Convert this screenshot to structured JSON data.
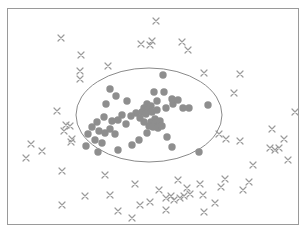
{
  "figure": {
    "caption": "",
    "frame": {
      "x": 7,
      "y": 8,
      "width": 292,
      "height": 217,
      "stroke": "#9a9a9a",
      "stroke_width": 1,
      "fill": "#ffffff"
    }
  },
  "colors": {
    "background": "#ffffff",
    "frame_border": "#9a9a9a",
    "inlier_marker": "#8e8e8e",
    "outlier_marker": "#9b9b9b",
    "ellipse_stroke": "#8a8a8a",
    "caption_text": "#cfcfcf"
  },
  "chart_data": {
    "type": "scatter",
    "title": "",
    "xlabel": "",
    "ylabel": "",
    "grid": false,
    "legend": null,
    "axis_visible": false,
    "xlim": [
      7,
      299
    ],
    "ylim": [
      8,
      225
    ],
    "note": "Pixel coordinates in the image frame; y increases downward.",
    "annotations": [
      {
        "kind": "ellipse",
        "name": "cluster-boundary-ellipse",
        "cx": 149,
        "cy": 115,
        "rx": 73,
        "ry": 47,
        "rotation_deg": 0,
        "stroke": "#8a8a8a",
        "stroke_width": 1,
        "fill": "none"
      }
    ],
    "series": [
      {
        "name": "inliers",
        "marker": "circle",
        "marker_size": 5,
        "color": "#8e8e8e",
        "count": 56,
        "points": [
          [
            163,
            75
          ],
          [
            154,
            92
          ],
          [
            157,
            101
          ],
          [
            164,
            92
          ],
          [
            110,
            89
          ],
          [
            116,
            96
          ],
          [
            106,
            104
          ],
          [
            127,
            101
          ],
          [
            147,
            104
          ],
          [
            151,
            106
          ],
          [
            144,
            108
          ],
          [
            148,
            110
          ],
          [
            142,
            112
          ],
          [
            146,
            114
          ],
          [
            152,
            112
          ],
          [
            157,
            110
          ],
          [
            166,
            108
          ],
          [
            173,
            104
          ],
          [
            178,
            100
          ],
          [
            172,
            99
          ],
          [
            183,
            108
          ],
          [
            136,
            113
          ],
          [
            155,
            119
          ],
          [
            151,
            122
          ],
          [
            156,
            123
          ],
          [
            160,
            121
          ],
          [
            149,
            126
          ],
          [
            153,
            127
          ],
          [
            158,
            128
          ],
          [
            162,
            126
          ],
          [
            144,
            122
          ],
          [
            140,
            118
          ],
          [
            131,
            116
          ],
          [
            122,
            115
          ],
          [
            118,
            120
          ],
          [
            126,
            124
          ],
          [
            112,
            121
          ],
          [
            104,
            117
          ],
          [
            97,
            122
          ],
          [
            92,
            127
          ],
          [
            99,
            131
          ],
          [
            105,
            133
          ],
          [
            110,
            129
          ],
          [
            115,
            134
          ],
          [
            88,
            134
          ],
          [
            95,
            140
          ],
          [
            102,
            143
          ],
          [
            86,
            146
          ],
          [
            98,
            152
          ],
          [
            118,
            150
          ],
          [
            132,
            145
          ],
          [
            139,
            140
          ],
          [
            147,
            133
          ],
          [
            167,
            137
          ],
          [
            172,
            147
          ],
          [
            199,
            152
          ],
          [
            189,
            108
          ],
          [
            208,
            105
          ]
        ]
      },
      {
        "name": "outliers",
        "marker": "x",
        "marker_size": 6,
        "color": "#9b9b9b",
        "count": 62,
        "points": [
          [
            156,
            21
          ],
          [
            61,
            38
          ],
          [
            141,
            44
          ],
          [
            152,
            41
          ],
          [
            150,
            45
          ],
          [
            182,
            42
          ],
          [
            188,
            50
          ],
          [
            81,
            55
          ],
          [
            80,
            71
          ],
          [
            80,
            79
          ],
          [
            108,
            66
          ],
          [
            204,
            73
          ],
          [
            240,
            74
          ],
          [
            57,
            111
          ],
          [
            234,
            93
          ],
          [
            66,
            125
          ],
          [
            70,
            126
          ],
          [
            64,
            131
          ],
          [
            72,
            139
          ],
          [
            71,
            142
          ],
          [
            31,
            144
          ],
          [
            42,
            151
          ],
          [
            26,
            158
          ],
          [
            219,
            134
          ],
          [
            226,
            139
          ],
          [
            240,
            141
          ],
          [
            272,
            129
          ],
          [
            284,
            139
          ],
          [
            270,
            148
          ],
          [
            275,
            150
          ],
          [
            279,
            148
          ],
          [
            62,
            171
          ],
          [
            105,
            175
          ],
          [
            135,
            184
          ],
          [
            85,
            196
          ],
          [
            110,
            195
          ],
          [
            62,
            205
          ],
          [
            178,
            180
          ],
          [
            187,
            188
          ],
          [
            200,
            184
          ],
          [
            166,
            198
          ],
          [
            171,
            196
          ],
          [
            174,
            200
          ],
          [
            180,
            198
          ],
          [
            184,
            196
          ],
          [
            190,
            194
          ],
          [
            159,
            190
          ],
          [
            150,
            202
          ],
          [
            203,
            195
          ],
          [
            221,
            187
          ],
          [
            225,
            179
          ],
          [
            243,
            190
          ],
          [
            249,
            182
          ],
          [
            132,
            218
          ],
          [
            204,
            212
          ],
          [
            118,
            211
          ],
          [
            166,
            210
          ],
          [
            140,
            205
          ],
          [
            215,
            203
          ],
          [
            253,
            165
          ],
          [
            288,
            160
          ],
          [
            295,
            112
          ]
        ]
      }
    ]
  }
}
